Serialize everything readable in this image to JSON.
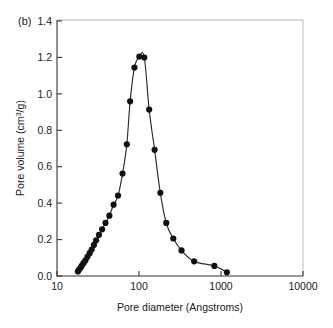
{
  "figure": {
    "panel_label": "(b)",
    "background_color": "#ffffff",
    "line_color": "#2b2b2b",
    "marker_color": "#111111",
    "frame_color": "#b9b9b9",
    "axis_color": "#333333"
  },
  "chart_data": {
    "type": "line",
    "title": "",
    "subtitle": "",
    "panel": "(b)",
    "xlabel": "Pore diameter (Angstroms)",
    "ylabel": "Pore volume (cm3/g)",
    "ylabel_base": "Pore volume (cm",
    "ylabel_sup": "3",
    "ylabel_tail": "/g)",
    "xscale": "log",
    "yscale": "linear",
    "xlim": [
      10,
      10000
    ],
    "ylim": [
      0.0,
      1.4
    ],
    "grid": false,
    "legend": null,
    "xticks": [
      10,
      100,
      1000,
      10000
    ],
    "xtick_labels": [
      "10",
      "100",
      "1000",
      "10000"
    ],
    "yticks": [
      0.0,
      0.2,
      0.4,
      0.6,
      0.8,
      1.0,
      1.2,
      1.4
    ],
    "ytick_labels": [
      "0.0",
      "0.2",
      "0.4",
      "0.6",
      "0.8",
      "1.0",
      "1.2",
      "1.4"
    ],
    "marker": "filled-circle",
    "series": [
      {
        "name": "pore size distribution",
        "x": [
          18.0,
          18.6,
          19.3,
          20.0,
          21.0,
          22.2,
          23.5,
          25.0,
          26.5,
          28.2,
          30.0,
          32.5,
          35.5,
          39.0,
          43.5,
          49.0,
          55.5,
          63.0,
          71.0,
          78.0,
          88.0,
          101.0,
          116.0,
          133.0,
          155.0,
          182.0,
          215.0,
          262.0,
          330.0,
          470.0,
          830.0,
          1180.0
        ],
        "y": [
          0.025,
          0.035,
          0.045,
          0.055,
          0.07,
          0.085,
          0.105,
          0.125,
          0.145,
          0.17,
          0.195,
          0.225,
          0.255,
          0.29,
          0.33,
          0.39,
          0.44,
          0.56,
          0.72,
          0.955,
          1.14,
          1.2,
          1.195,
          0.91,
          0.69,
          0.455,
          0.29,
          0.205,
          0.14,
          0.08,
          0.055,
          0.02
        ]
      }
    ]
  }
}
